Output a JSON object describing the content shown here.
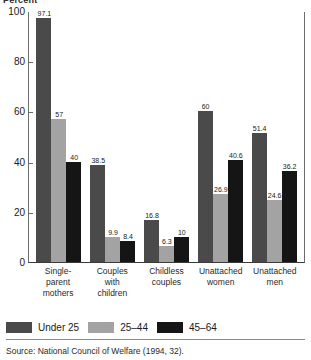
{
  "chart_data": {
    "type": "bar",
    "title": "",
    "xlabel": "",
    "ylabel": "Percent",
    "ylim": [
      0,
      100
    ],
    "yticks": [
      0,
      20,
      40,
      60,
      80,
      100
    ],
    "grid": false,
    "legend_position": "bottom",
    "categories": [
      "Single-parent mothers",
      "Couples with children",
      "Childless couples",
      "Unattached women",
      "Unattached men"
    ],
    "series": [
      {
        "name": "Under 25",
        "color": "#4a4a4a",
        "values": [
          97.1,
          38.5,
          16.8,
          60,
          51.4
        ]
      },
      {
        "name": "25–44",
        "color": "#a3a3a3",
        "values": [
          57,
          9.9,
          6.3,
          26.9,
          24.6
        ]
      },
      {
        "name": "45–64",
        "color": "#151515",
        "values": [
          40,
          8.4,
          10,
          40.6,
          36.2
        ]
      }
    ],
    "value_labels": [
      [
        "97.1",
        "57",
        "40"
      ],
      [
        "38.5",
        "9.9",
        "8.4"
      ],
      [
        "16.8",
        "6.3",
        "10"
      ],
      [
        "60",
        "26.9",
        "40.6"
      ],
      [
        "51.4",
        "24.6",
        "36.2"
      ]
    ],
    "category_lines": [
      [
        "Single-",
        "parent",
        "mothers"
      ],
      [
        "Couples",
        "with",
        "children"
      ],
      [
        "Childless",
        "couples"
      ],
      [
        "Unattached",
        "women"
      ],
      [
        "Unattached",
        "men"
      ]
    ]
  },
  "axis": {
    "y_title": "Percent",
    "tick_labels": [
      "100",
      "80",
      "60",
      "40",
      "20",
      "0"
    ]
  },
  "legend": {
    "items": [
      {
        "label": "Under 25",
        "color": "#4a4a4a"
      },
      {
        "label": "25–44",
        "color": "#a3a3a3"
      },
      {
        "label": "45–64",
        "color": "#151515"
      }
    ]
  },
  "footer": {
    "source": "Source: National Council of Welfare (1994, 32)."
  }
}
